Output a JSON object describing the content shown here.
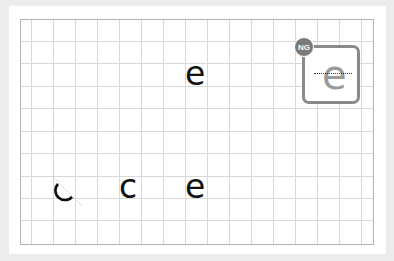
{
  "worksheet": {
    "grid": {
      "columns": 16,
      "rows": 10,
      "line_color": "#d8d8d8",
      "border_color": "#b4b4b4"
    },
    "target_letter": {
      "char": "e"
    },
    "practice_letters": [
      {
        "char": "c",
        "state": "partial-stroke"
      },
      {
        "char": "c",
        "state": "complete"
      },
      {
        "char": "e",
        "state": "complete"
      }
    ],
    "ng_example": {
      "badge_label": "NG",
      "char": "e",
      "badge_color": "#7a7a7a",
      "frame_color": "#8a8a8a"
    }
  }
}
